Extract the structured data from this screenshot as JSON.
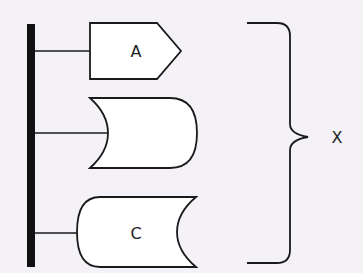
{
  "diagram": {
    "background": "#f4f2f7",
    "stroke_color": "#1a1a1a",
    "shape_fill": "#ffffff",
    "bus": {
      "label": ""
    },
    "shapes": [
      {
        "id": "A",
        "label": "A",
        "type": "pentagon-arrow"
      },
      {
        "id": "B",
        "label": "",
        "type": "concave-left-rounded-right"
      },
      {
        "id": "C",
        "label": "C",
        "type": "rounded-left-concave-right"
      }
    ],
    "brace": {
      "label": "X"
    }
  }
}
